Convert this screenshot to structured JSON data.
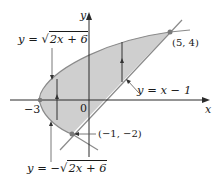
{
  "figure": {
    "axes": {
      "x_label": "x",
      "y_label": "y",
      "origin_label": "0",
      "x_tick_label": "−3"
    },
    "curves": {
      "upper_parabola": {
        "prefix": "y = ",
        "radical": "√",
        "radicand": "2x + 6"
      },
      "lower_parabola": {
        "prefix": "y = −",
        "radical": "√",
        "radicand": "2x + 6"
      },
      "line": {
        "label": "y = x − 1"
      }
    },
    "points": {
      "intersection_top": "(5, 4)",
      "intersection_bottom": "(−1, −2)",
      "vertex": "(−3, 0)"
    },
    "colors": {
      "shade": "#c9c9c9",
      "curve": "#8a8a8a",
      "axis": "#2a2a2a",
      "text": "#1a1a1a",
      "point": "#7a7a7a"
    }
  }
}
